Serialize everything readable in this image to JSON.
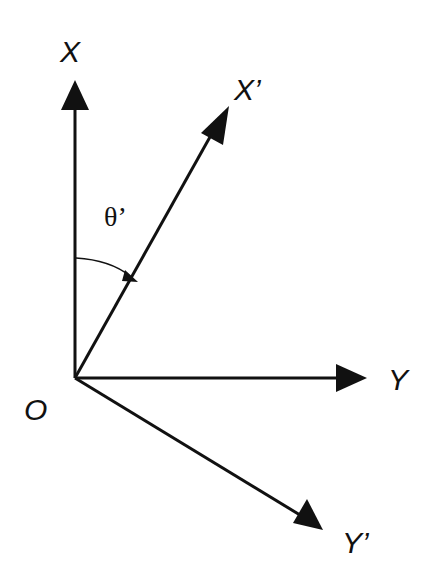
{
  "diagram": {
    "type": "coordinate-rotation",
    "origin_label": "O",
    "axes": [
      {
        "id": "x",
        "label": "X"
      },
      {
        "id": "x-prime",
        "label": "X’"
      },
      {
        "id": "y",
        "label": "Y"
      },
      {
        "id": "y-prime",
        "label": "Y’"
      }
    ],
    "angle_label": "θ’",
    "colors": {
      "stroke": "#111111",
      "background": "#ffffff"
    }
  }
}
